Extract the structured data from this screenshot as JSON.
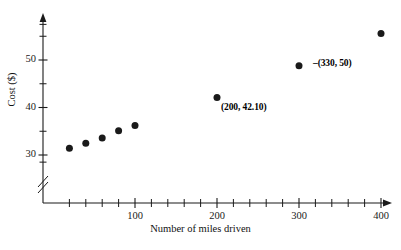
{
  "chart_data": {
    "type": "scatter",
    "title": "",
    "xlabel": "Number of miles driven",
    "ylabel": "Cost ($)",
    "xlim": [
      0,
      420
    ],
    "ylim": [
      28,
      57
    ],
    "grid": false,
    "legend": "none",
    "y_axis_break": true,
    "x_ticks_major": [
      100,
      200,
      300,
      400
    ],
    "x_ticks_minor": [
      20,
      40,
      60,
      80,
      120,
      140,
      160,
      180,
      220,
      240,
      260,
      280,
      320,
      340,
      360,
      380
    ],
    "x_tick_step": 20,
    "y_ticks_major": [
      30,
      40,
      50
    ],
    "y_ticks_minor": [
      35,
      45,
      55
    ],
    "x_tick_labels": [
      "100",
      "200",
      "300",
      "400"
    ],
    "y_tick_labels": [
      "30",
      "40",
      "50"
    ],
    "points": [
      {
        "x": 20,
        "y": 31.4
      },
      {
        "x": 40,
        "y": 32.5
      },
      {
        "x": 60,
        "y": 33.6
      },
      {
        "x": 80,
        "y": 35.1
      },
      {
        "x": 100,
        "y": 36.2
      },
      {
        "x": 200,
        "y": 42.1
      },
      {
        "x": 300,
        "y": 48.8
      },
      {
        "x": 400,
        "y": 55.6
      }
    ],
    "annotations": [
      {
        "text": "(200, 42.10)",
        "point_x": 200,
        "point_y": 42.1,
        "leader": false
      },
      {
        "text": "(330, 50)",
        "point_x": 300,
        "point_y": 48.8,
        "leader": true
      }
    ]
  },
  "style": {
    "axis_color": "#1a1a1a",
    "point_color": "#1a1a1a",
    "background": "#ffffff"
  }
}
